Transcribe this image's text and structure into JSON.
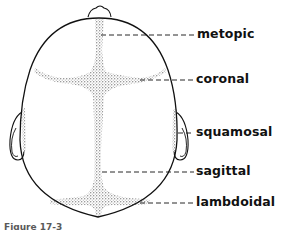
{
  "figure": {
    "colors": {
      "line": "#111111",
      "stipple": "#333333",
      "background": "#ffffff"
    },
    "labels": [
      {
        "id": "metopic",
        "text": "metopic"
      },
      {
        "id": "coronal",
        "text": "coronal"
      },
      {
        "id": "squamosal",
        "text": "squamosal"
      },
      {
        "id": "sagittal",
        "text": "sagittal"
      },
      {
        "id": "lambdoidal",
        "text": "lambdoidal"
      }
    ],
    "caption": "Figure 17-3"
  }
}
